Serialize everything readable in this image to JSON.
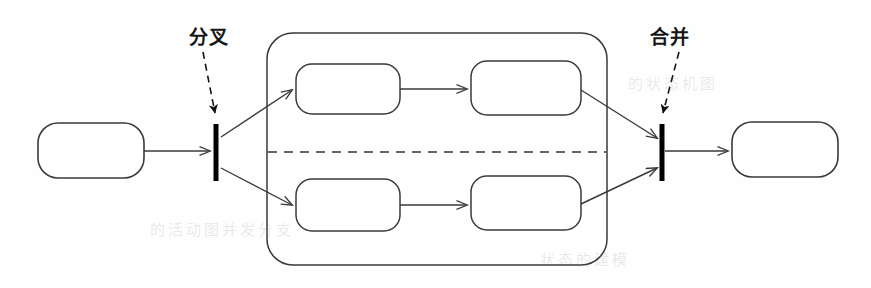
{
  "diagram": {
    "canvas": {
      "width": 871,
      "height": 288,
      "background": "#fefefe"
    },
    "style": {
      "stroke_color": "#3a3a3a",
      "bar_color": "#000000",
      "dashed_color": "#333333",
      "label_color": "#151515",
      "fill_color": "#ffffff"
    },
    "annotations": [
      {
        "id": "fork-annotation",
        "text": "分叉",
        "meaning": "fork",
        "label_x": 189,
        "label_y": 28,
        "leader_from": [
          203,
          52
        ],
        "leader_to": [
          216,
          118
        ]
      },
      {
        "id": "join-annotation",
        "text": "合并",
        "meaning": "join",
        "label_x": 650,
        "label_y": 28,
        "leader_from": [
          678,
          52
        ],
        "leader_to": [
          662,
          118
        ]
      }
    ],
    "nodes": [
      {
        "id": "start-activity",
        "label": "",
        "shape": "rounded-rect",
        "x": 38,
        "y": 123,
        "w": 106,
        "h": 55,
        "r": 20
      },
      {
        "id": "top-activity-1",
        "label": "",
        "shape": "rounded-rect",
        "x": 296,
        "y": 64,
        "w": 104,
        "h": 50,
        "r": 16
      },
      {
        "id": "top-activity-2",
        "label": "",
        "shape": "rounded-rect",
        "x": 471,
        "y": 61,
        "w": 110,
        "h": 54,
        "r": 16
      },
      {
        "id": "bottom-activity-1",
        "label": "",
        "shape": "rounded-rect",
        "x": 296,
        "y": 179,
        "w": 104,
        "h": 52,
        "r": 16
      },
      {
        "id": "bottom-activity-2",
        "label": "",
        "shape": "rounded-rect",
        "x": 471,
        "y": 176,
        "w": 110,
        "h": 54,
        "r": 16
      },
      {
        "id": "end-activity",
        "label": "",
        "shape": "rounded-rect",
        "x": 732,
        "y": 122,
        "w": 106,
        "h": 55,
        "r": 20
      }
    ],
    "bars": [
      {
        "id": "fork-bar",
        "x": 216,
        "y_top": 124,
        "y_bottom": 181,
        "thickness": 5
      },
      {
        "id": "join-bar",
        "x": 662,
        "y_top": 124,
        "y_bottom": 181,
        "thickness": 5
      }
    ],
    "container": {
      "id": "concurrent-region",
      "x": 267,
      "y": 33,
      "w": 340,
      "h": 232,
      "r": 26,
      "divider": {
        "id": "swimlane-divider",
        "y": 152,
        "x_start": 268,
        "x_end": 606,
        "style": "dashed"
      }
    },
    "edges": [
      {
        "id": "edge-start-to-fork",
        "from": "start-activity",
        "to": "fork-bar",
        "points": [
          [
            144,
            151
          ],
          [
            212,
            151
          ]
        ]
      },
      {
        "id": "edge-fork-to-top1",
        "from": "fork-bar",
        "to": "top-activity-1",
        "points": [
          [
            220,
            136
          ],
          [
            293,
            90
          ]
        ]
      },
      {
        "id": "edge-fork-to-bottom1",
        "from": "fork-bar",
        "to": "bottom-activity-1",
        "points": [
          [
            220,
            169
          ],
          [
            293,
            206
          ]
        ]
      },
      {
        "id": "edge-top1-to-top2",
        "from": "top-activity-1",
        "to": "top-activity-2",
        "points": [
          [
            400,
            89
          ],
          [
            468,
            89
          ]
        ]
      },
      {
        "id": "edge-bottom1-to-bottom2",
        "from": "bottom-activity-1",
        "to": "bottom-activity-2",
        "points": [
          [
            400,
            205
          ],
          [
            468,
            205
          ]
        ]
      },
      {
        "id": "edge-top2-to-join",
        "from": "top-activity-2",
        "to": "join-bar",
        "points": [
          [
            581,
            90
          ],
          [
            658,
            137
          ]
        ]
      },
      {
        "id": "edge-bottom2-to-join",
        "from": "bottom-activity-2",
        "to": "join-bar",
        "points": [
          [
            581,
            204
          ],
          [
            658,
            169
          ]
        ]
      },
      {
        "id": "edge-join-to-end",
        "from": "join-bar",
        "to": "end-activity",
        "points": [
          [
            666,
            151
          ],
          [
            728,
            151
          ]
        ]
      }
    ],
    "ghost_text": [
      {
        "text": "的状态机图",
        "x": 628,
        "y": 72
      },
      {
        "text": "的活动图并发分支",
        "x": 150,
        "y": 218
      },
      {
        "text": "状态的建模",
        "x": 540,
        "y": 248
      }
    ]
  }
}
